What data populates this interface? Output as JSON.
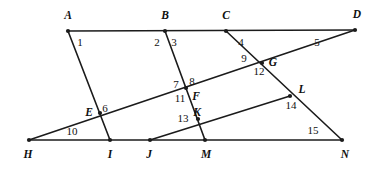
{
  "figure": {
    "width": 379,
    "height": 169,
    "stroke_color": "#1b1b1b",
    "background_color": "#ffffff",
    "vertices": [
      {
        "id": "A",
        "label": "A",
        "x": 68,
        "y": 31,
        "lx": 68,
        "ly": 16
      },
      {
        "id": "B",
        "label": "B",
        "x": 165,
        "y": 31,
        "lx": 165,
        "ly": 16
      },
      {
        "id": "C",
        "label": "C",
        "x": 226,
        "y": 31,
        "lx": 226,
        "ly": 16
      },
      {
        "id": "D",
        "label": "D",
        "x": 355,
        "y": 30,
        "lx": 357,
        "ly": 15
      },
      {
        "id": "E",
        "label": "E",
        "x": 100,
        "y": 113,
        "lx": 89,
        "ly": 113
      },
      {
        "id": "F",
        "label": "F",
        "x": 186,
        "y": 88,
        "lx": 196,
        "ly": 97
      },
      {
        "id": "G",
        "label": "G",
        "x": 262,
        "y": 63,
        "lx": 273,
        "ly": 63
      },
      {
        "id": "H",
        "label": "H",
        "x": 29,
        "y": 140,
        "lx": 28,
        "ly": 155
      },
      {
        "id": "I",
        "label": "I",
        "x": 110,
        "y": 140,
        "lx": 110,
        "ly": 155
      },
      {
        "id": "J",
        "label": "J",
        "x": 150,
        "y": 140,
        "lx": 149,
        "ly": 155
      },
      {
        "id": "K",
        "label": "K",
        "x": 198,
        "y": 119,
        "lx": 197,
        "ly": 113
      },
      {
        "id": "L",
        "label": "L",
        "x": 290,
        "y": 96,
        "lx": 302,
        "ly": 90
      },
      {
        "id": "M",
        "label": "M",
        "x": 205,
        "y": 140,
        "lx": 206,
        "ly": 155
      },
      {
        "id": "N",
        "label": "N",
        "x": 342,
        "y": 140,
        "lx": 345,
        "ly": 155
      }
    ],
    "segments": [
      {
        "id": "top-edge",
        "from": "A",
        "to": "D"
      },
      {
        "id": "bottom-edge",
        "from": "H",
        "to": "N"
      },
      {
        "id": "transversal-A-I",
        "from": "A",
        "to": "I"
      },
      {
        "id": "transversal-B-M",
        "from": "B",
        "to": "M"
      },
      {
        "id": "transversal-C-N",
        "from": "C",
        "to": "N"
      },
      {
        "id": "transversal-H-D",
        "from": "H",
        "to": "D"
      },
      {
        "id": "transversal-J-L",
        "from": "J",
        "to": "L"
      }
    ],
    "angle_labels": [
      {
        "id": "1",
        "label": "1",
        "x": 80,
        "y": 42
      },
      {
        "id": "2",
        "label": "2",
        "x": 157,
        "y": 42
      },
      {
        "id": "3",
        "label": "3",
        "x": 174,
        "y": 42
      },
      {
        "id": "4",
        "label": "4",
        "x": 241,
        "y": 42
      },
      {
        "id": "5",
        "label": "5",
        "x": 317,
        "y": 42
      },
      {
        "id": "6",
        "label": "6",
        "x": 105,
        "y": 108
      },
      {
        "id": "7",
        "label": "7",
        "x": 176,
        "y": 84
      },
      {
        "id": "8",
        "label": "8",
        "x": 192,
        "y": 81
      },
      {
        "id": "9",
        "label": "9",
        "x": 244,
        "y": 58
      },
      {
        "id": "10",
        "label": "10",
        "x": 72,
        "y": 131
      },
      {
        "id": "11",
        "label": "11",
        "x": 180,
        "y": 98
      },
      {
        "id": "12",
        "label": "12",
        "x": 259,
        "y": 71
      },
      {
        "id": "13",
        "label": "13",
        "x": 183,
        "y": 118
      },
      {
        "id": "14",
        "label": "14",
        "x": 291,
        "y": 105
      },
      {
        "id": "15",
        "label": "15",
        "x": 313,
        "y": 130
      }
    ]
  }
}
